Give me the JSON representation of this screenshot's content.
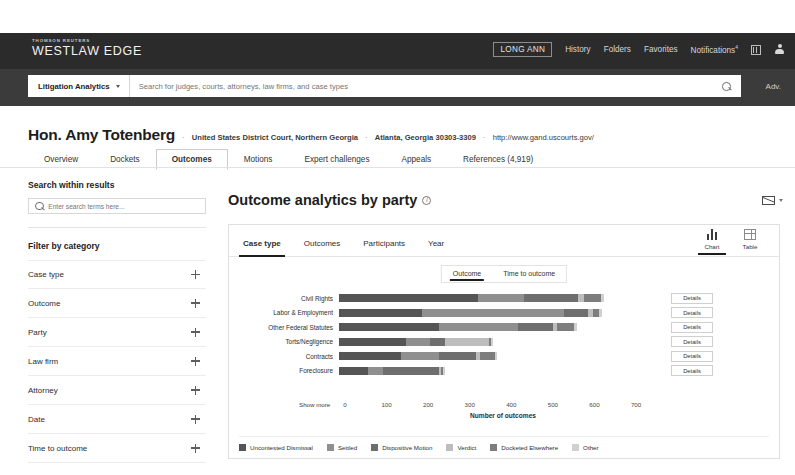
{
  "brand": {
    "eyebrow": "THOMSON REUTERS",
    "product": "WESTLAW EDGE"
  },
  "topnav": {
    "user": "LONG ANN",
    "items": [
      "History",
      "Folders",
      "Favorites"
    ],
    "notifications": "Notifications",
    "notifications_sup": "4",
    "grid_icon": "grid-icon",
    "profile_icon": "person-icon"
  },
  "search": {
    "scope": "Litigation Analytics",
    "placeholder": "Search for judges, courts, attorneys, law firms, and case types",
    "search_icon": "magnifier-icon",
    "advanced": "Adv."
  },
  "judge": {
    "name": "Hon. Amy Totenberg",
    "court": "United States District Court, Northern Georgia",
    "address": "Atlanta, Georgia 30303-3309",
    "url": "http://www.gand.uscourts.gov/"
  },
  "main_tabs": [
    {
      "label": "Overview",
      "active": false
    },
    {
      "label": "Dockets",
      "active": false
    },
    {
      "label": "Outcomes",
      "active": true
    },
    {
      "label": "Motions",
      "active": false
    },
    {
      "label": "Expert challenges",
      "active": false
    },
    {
      "label": "Appeals",
      "active": false
    },
    {
      "label": "References (4,919)",
      "active": false
    }
  ],
  "sidebar": {
    "search_heading": "Search within results",
    "search_placeholder": "Enter search terms here...",
    "search_icon": "magnifier-icon",
    "filter_heading": "Filter by category",
    "filters": [
      {
        "label": "Case type"
      },
      {
        "label": "Outcome"
      },
      {
        "label": "Party"
      },
      {
        "label": "Law firm"
      },
      {
        "label": "Attorney"
      },
      {
        "label": "Date"
      },
      {
        "label": "Time to outcome"
      }
    ]
  },
  "panel": {
    "title": "Outcome analytics by party",
    "info_icon": "info-icon",
    "mail_icon": "envelope-icon",
    "mail_caret": "chevron-down-icon",
    "tabs": [
      {
        "label": "Case type",
        "active": true
      },
      {
        "label": "Outcomes",
        "active": false
      },
      {
        "label": "Participants",
        "active": false
      },
      {
        "label": "Year",
        "active": false
      }
    ],
    "view_toggle": [
      {
        "label": "Chart",
        "icon": "bar-chart-icon",
        "active": true
      },
      {
        "label": "Table",
        "icon": "table-icon",
        "active": false
      }
    ],
    "sub_toggle": [
      {
        "label": "Outcome",
        "active": true
      },
      {
        "label": "Time to outcome",
        "active": false
      }
    ],
    "details_label": "Details",
    "show_more": "Show more"
  },
  "chart_data": {
    "type": "bar",
    "orientation": "horizontal",
    "stacked": true,
    "title": "Outcome analytics by party",
    "xlabel": "Number of outcomes",
    "ylabel": "",
    "xlim": [
      0,
      760
    ],
    "xticks": [
      0,
      100,
      200,
      300,
      400,
      500,
      600,
      700
    ],
    "grid": false,
    "legend_position": "bottom",
    "categories": [
      "Civil Rights",
      "Labor & Employment",
      "Other Federal Statutes",
      "Torts/Negligence",
      "Contracts",
      "Foreclosure"
    ],
    "series": [
      {
        "name": "Uncontested Dismissal",
        "color": "#555555",
        "values": [
          335,
          200,
          240,
          160,
          150,
          70
        ]
      },
      {
        "name": "Settled",
        "color": "#8f8f8f",
        "values": [
          110,
          340,
          190,
          60,
          90,
          35
        ]
      },
      {
        "name": "Dispositive Motion",
        "color": "#6e6e6e",
        "values": [
          130,
          60,
          85,
          35,
          90,
          135
        ]
      },
      {
        "name": "Verdict",
        "color": "#bdbdbd",
        "values": [
          15,
          10,
          10,
          105,
          10,
          5
        ]
      },
      {
        "name": "Docketed Elsewhere",
        "color": "#7d7d7d",
        "values": [
          40,
          15,
          40,
          5,
          35,
          5
        ]
      },
      {
        "name": "Other",
        "color": "#d0d0d0",
        "values": [
          8,
          8,
          8,
          5,
          5,
          5
        ]
      }
    ],
    "totals": [
      638,
      633,
      573,
      370,
      380,
      255
    ]
  }
}
